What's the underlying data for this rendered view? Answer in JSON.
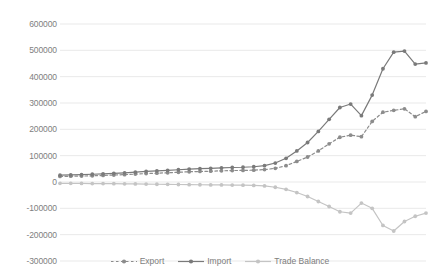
{
  "chart_data": {
    "type": "line",
    "title": "",
    "subtitle": "",
    "xlabel": "",
    "ylabel": "",
    "ylim": [
      -300000,
      600000
    ],
    "ytick_labels": [
      "600000",
      "500000",
      "400000",
      "300000",
      "200000",
      "100000",
      "0",
      "-100000",
      "-200000",
      "-300000"
    ],
    "ytick_values": [
      600000,
      500000,
      400000,
      300000,
      200000,
      100000,
      0,
      -100000,
      -200000,
      -300000
    ],
    "xtick_labels": [],
    "grid": true,
    "legend_position": "bottom",
    "x": [
      1,
      2,
      3,
      4,
      5,
      6,
      7,
      8,
      9,
      10,
      11,
      12,
      13,
      14,
      15,
      16,
      17,
      18,
      19,
      20,
      21,
      22,
      23,
      24,
      25,
      26,
      27,
      28,
      29,
      30,
      31,
      32,
      33,
      34,
      35
    ],
    "series": [
      {
        "name": "Export",
        "color": "#8c8c8c",
        "style": "dashed",
        "marker": "circle",
        "values": [
          21000,
          22000,
          22500,
          23500,
          25000,
          26500,
          28000,
          30000,
          32000,
          33500,
          35000,
          37000,
          39000,
          40000,
          41000,
          42500,
          43500,
          44000,
          45000,
          47000,
          52000,
          62000,
          78000,
          95000,
          118000,
          145000,
          170000,
          178000,
          172000,
          230000,
          265000,
          272000,
          278000,
          248000,
          268000
        ]
      },
      {
        "name": "Import",
        "color": "#7a7a7a",
        "style": "solid",
        "marker": "circle",
        "values": [
          26000,
          27000,
          28000,
          29500,
          31000,
          33000,
          35000,
          37500,
          40000,
          42000,
          44000,
          46500,
          49000,
          50500,
          52000,
          53500,
          55000,
          56000,
          58000,
          62000,
          72000,
          90000,
          118000,
          150000,
          192000,
          238000,
          283000,
          296000,
          252000,
          330000,
          430000,
          493000,
          497000,
          448000,
          452000
        ]
      },
      {
        "name": "Trade Balance",
        "color": "#c4c4c4",
        "style": "solid",
        "marker": "circle",
        "values": [
          -5000,
          -5000,
          -5500,
          -6000,
          -6000,
          -6500,
          -7000,
          -7500,
          -8000,
          -8500,
          -9000,
          -9500,
          -10000,
          -10500,
          -11000,
          -11000,
          -11500,
          -12000,
          -13000,
          -15000,
          -20000,
          -28000,
          -40000,
          -55000,
          -74000,
          -93000,
          -113000,
          -118000,
          -80000,
          -100000,
          -165000,
          -186000,
          -150000,
          -130000,
          -118000
        ]
      }
    ]
  },
  "legend": {
    "items": [
      {
        "label": "Export"
      },
      {
        "label": "Import"
      },
      {
        "label": "Trade Balance"
      }
    ]
  }
}
